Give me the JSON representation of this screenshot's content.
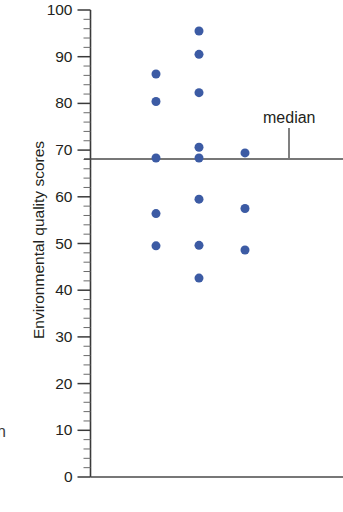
{
  "chart_data": {
    "type": "scatter",
    "title": "",
    "subtitle": "",
    "xlabel": "",
    "ylabel": "Environmental quality scores",
    "ylim": [
      0,
      100
    ],
    "xlim": [
      0,
      4
    ],
    "grid": false,
    "legend": null,
    "y_ticks": [
      0,
      10,
      20,
      30,
      40,
      50,
      60,
      70,
      80,
      90,
      100
    ],
    "y_tick_labels": [
      "0",
      "10",
      "20",
      "30",
      "40",
      "50",
      "60",
      "70",
      "80",
      "90",
      "100"
    ],
    "y_minor_tick_step": 2,
    "x_ticks": [],
    "x_tick_labels": [],
    "series": [
      {
        "name": "Environmental quality scores",
        "color": "#3c5ba4",
        "marker": "circle",
        "marker_size": 9,
        "points": [
          {
            "group": 1,
            "x": 1,
            "y": 86.3
          },
          {
            "group": 1,
            "x": 1,
            "y": 80.4
          },
          {
            "group": 1,
            "x": 1,
            "y": 68.3
          },
          {
            "group": 1,
            "x": 1,
            "y": 56.4
          },
          {
            "group": 1,
            "x": 1,
            "y": 49.5
          },
          {
            "group": 2,
            "x": 2,
            "y": 95.5
          },
          {
            "group": 2,
            "x": 2,
            "y": 90.5
          },
          {
            "group": 2,
            "x": 2,
            "y": 82.3
          },
          {
            "group": 2,
            "x": 2,
            "y": 70.6
          },
          {
            "group": 2,
            "x": 2,
            "y": 68.3
          },
          {
            "group": 2,
            "x": 2,
            "y": 59.5
          },
          {
            "group": 2,
            "x": 2,
            "y": 49.6
          },
          {
            "group": 2,
            "x": 2,
            "y": 42.6
          },
          {
            "group": 3,
            "x": 3,
            "y": 69.4
          },
          {
            "group": 3,
            "x": 3,
            "y": 57.5
          },
          {
            "group": 3,
            "x": 3,
            "y": 48.6
          }
        ]
      }
    ],
    "annotations": [
      {
        "name": "median",
        "label": "median",
        "type": "hline",
        "value": 68.1,
        "color": "#4a4a4a"
      },
      {
        "name": "baseline",
        "label": "",
        "type": "hline",
        "value": 0,
        "color": "#4a4a4a"
      }
    ]
  },
  "axis": {
    "y_title": "Environmental quality scores",
    "tick_labels": {
      "t100": "100",
      "t90": "90",
      "t80": "80",
      "t70": "70",
      "t60": "60",
      "t50": "50",
      "t40": "40",
      "t30": "30",
      "t20": "20",
      "t10": "10",
      "t0": "0"
    }
  },
  "annotations": {
    "median_label": "median",
    "cropped_edge_glyph": "n"
  },
  "colors": {
    "dot": "#3c5ba4",
    "axis": "#3a3a3a",
    "median": "#4a4a4a",
    "text": "#231f20",
    "background": "#ffffff"
  }
}
